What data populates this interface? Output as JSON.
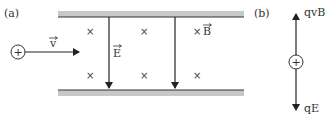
{
  "panels": {
    "a": {
      "label": "(a)",
      "velocity_label": "v",
      "electric_field_label": "E",
      "magnetic_field_label": "B",
      "charge_sign": "+",
      "field_into_page_symbol": "×"
    },
    "b": {
      "label": "(b)",
      "charge_sign": "+",
      "upward_force_label": "qvB",
      "downward_force_label": "qE"
    }
  },
  "colors": {
    "plate_fill": "#c8c8c8",
    "plate_edge": "#333333",
    "line": "#222222",
    "text": "#333333"
  }
}
